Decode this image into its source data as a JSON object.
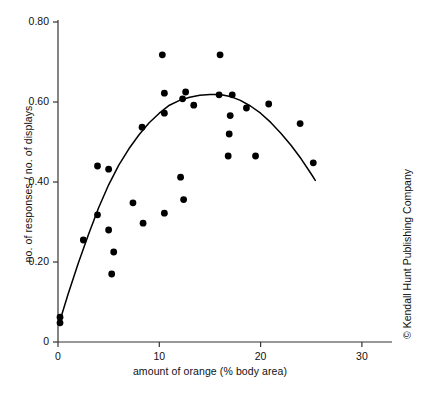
{
  "figure": {
    "title": "",
    "xlabel": "amount of orange (% body area)",
    "ylabel": "no. of responses / no. of displays",
    "copyright": "© Kendall Hunt Publishing Company",
    "xticks": [
      "0",
      "10",
      "20",
      "30"
    ],
    "yticks": [
      "0",
      "0.20",
      "0.40",
      "0.60",
      "0.80"
    ],
    "marker_color": "#000000",
    "line_color": "#000000",
    "axis_color": "#333333",
    "background": "#ffffff"
  },
  "chart_data": {
    "type": "scatter",
    "title": "",
    "xlabel": "amount of orange (% body area)",
    "ylabel": "no. of responses / no. of displays",
    "xlim": [
      0,
      32
    ],
    "ylim": [
      0,
      0.8
    ],
    "xticks": [
      0,
      10,
      20,
      30
    ],
    "yticks": [
      0,
      0.2,
      0.4,
      0.6,
      0.8
    ],
    "grid": false,
    "legend": null,
    "series": [
      {
        "name": "observations",
        "type": "scatter",
        "marker": "circle",
        "color": "#000000",
        "points": [
          [
            0.2,
            0.062
          ],
          [
            0.2,
            0.048
          ],
          [
            2.5,
            0.255
          ],
          [
            3.9,
            0.44
          ],
          [
            3.9,
            0.318
          ],
          [
            5.0,
            0.432
          ],
          [
            5.0,
            0.28
          ],
          [
            5.5,
            0.225
          ],
          [
            5.3,
            0.17
          ],
          [
            7.4,
            0.348
          ],
          [
            8.3,
            0.537
          ],
          [
            8.4,
            0.297
          ],
          [
            10.3,
            0.718
          ],
          [
            10.5,
            0.622
          ],
          [
            10.5,
            0.572
          ],
          [
            10.5,
            0.322
          ],
          [
            12.1,
            0.412
          ],
          [
            12.3,
            0.608
          ],
          [
            12.6,
            0.625
          ],
          [
            12.4,
            0.356
          ],
          [
            13.4,
            0.592
          ],
          [
            16.0,
            0.718
          ],
          [
            15.9,
            0.618
          ],
          [
            17.2,
            0.618
          ],
          [
            17.0,
            0.566
          ],
          [
            16.9,
            0.52
          ],
          [
            16.8,
            0.465
          ],
          [
            18.6,
            0.585
          ],
          [
            19.5,
            0.465
          ],
          [
            20.8,
            0.595
          ],
          [
            23.9,
            0.546
          ],
          [
            25.2,
            0.448
          ]
        ]
      },
      {
        "name": "fitted quadratic curve",
        "type": "line",
        "color": "#000000",
        "points": [
          [
            0.15,
            0.05
          ],
          [
            1.0,
            0.12
          ],
          [
            2.0,
            0.197
          ],
          [
            3.0,
            0.268
          ],
          [
            4.0,
            0.335
          ],
          [
            5.0,
            0.393
          ],
          [
            6.0,
            0.442
          ],
          [
            7.0,
            0.483
          ],
          [
            8.0,
            0.518
          ],
          [
            9.0,
            0.548
          ],
          [
            10.0,
            0.572
          ],
          [
            11.0,
            0.592
          ],
          [
            12.0,
            0.604
          ],
          [
            13.0,
            0.612
          ],
          [
            14.0,
            0.617
          ],
          [
            15.0,
            0.619
          ],
          [
            16.0,
            0.619
          ],
          [
            17.0,
            0.614
          ],
          [
            18.0,
            0.604
          ],
          [
            19.0,
            0.59
          ],
          [
            20.0,
            0.572
          ],
          [
            21.0,
            0.549
          ],
          [
            22.0,
            0.522
          ],
          [
            23.0,
            0.492
          ],
          [
            24.0,
            0.458
          ],
          [
            25.0,
            0.42
          ],
          [
            25.4,
            0.404
          ]
        ]
      }
    ]
  }
}
